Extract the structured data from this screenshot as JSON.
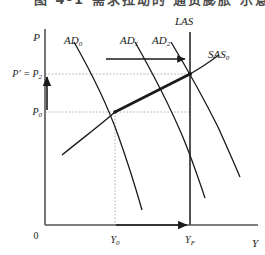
{
  "header": {
    "cut_off_text": "图 4-1  需求拉动的 通货膨胀 示意图"
  },
  "figure": {
    "axes": {
      "y_axis_label": "P",
      "x_axis_label": "Y",
      "origin_label": "0"
    },
    "curves": [
      {
        "id": "ad0",
        "label": "AD",
        "subscript": "0",
        "name": "aggregate-demand-0"
      },
      {
        "id": "ad1",
        "label": "AD",
        "subscript": "1",
        "name": "aggregate-demand-1"
      },
      {
        "id": "ad2",
        "label": "AD",
        "subscript": "2",
        "name": "aggregate-demand-2"
      },
      {
        "id": "las",
        "label": "LAS",
        "subscript": "",
        "name": "long-run-aggregate-supply"
      },
      {
        "id": "sas0",
        "label": "SAS",
        "subscript": "0",
        "name": "short-run-aggregate-supply-0"
      }
    ],
    "price_ticks": [
      {
        "id": "p_star",
        "label": "P' = P",
        "subscript": "2",
        "value_y": 67
      },
      {
        "id": "p0",
        "label": "P",
        "subscript": "0",
        "value_y": 105
      }
    ],
    "output_ticks": [
      {
        "id": "y0",
        "label": "Y",
        "subscript": "0",
        "value_x": 115
      },
      {
        "id": "yf",
        "label": "Y",
        "subscript": "F",
        "value_x": 190
      }
    ],
    "annotations": {
      "demand_shift_arrow": "rightward-shift-of-AD",
      "price_rise_arrow": "upward-price-level-arrow",
      "output_expansion_arrow": "rightward-output-arrow",
      "adjustment_path": "thick-SAS-segment-between-equilibria"
    },
    "colors": {
      "line": "#1a1a1a",
      "guide": "#9a9a9a",
      "background": "#ffffff"
    }
  }
}
